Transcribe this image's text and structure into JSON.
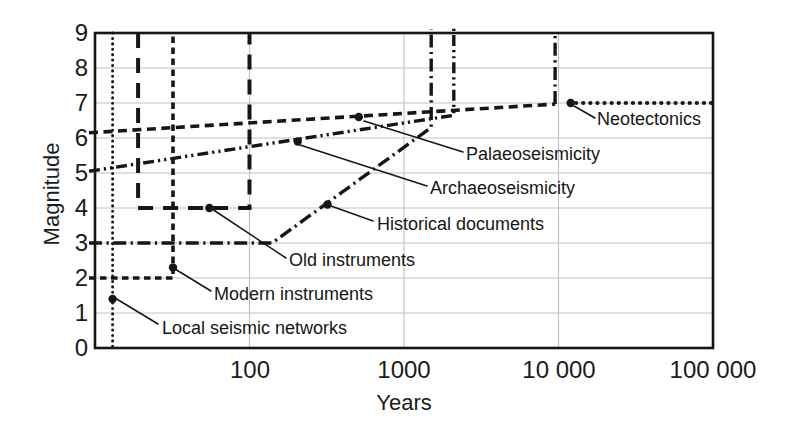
{
  "figure": {
    "background": "#ffffff",
    "ink_color": "#161616",
    "grid_color": "#c2c2c2"
  },
  "chart_data": {
    "type": "line",
    "title": "",
    "x_axis": {
      "title": "Years",
      "scale": "log",
      "range_years": [
        10,
        100000
      ],
      "ticks": [
        {
          "label": "100",
          "years": 100
        },
        {
          "label": "1000",
          "years": 1000
        },
        {
          "label": "10 000",
          "years": 10000
        },
        {
          "label": "100 000",
          "years": 100000
        }
      ]
    },
    "y_axis": {
      "title": "Magnitude",
      "range": [
        0,
        9
      ],
      "ticks": [
        "9",
        "8",
        "7",
        "6",
        "5",
        "4",
        "3",
        "2",
        "1",
        "0"
      ]
    },
    "grid": {
      "horizontal_at_magnitude": [
        1,
        2,
        3,
        4,
        5,
        6,
        7,
        8
      ],
      "vertical_at_years": [
        100,
        1000,
        10000
      ]
    },
    "series": [
      {
        "id": "local-seismic-networks",
        "label": "Local seismic networks",
        "line_style": "fine-dotted",
        "segments": [
          {
            "path": [
              [
                13,
                9
              ],
              [
                13,
                0
              ]
            ]
          }
        ],
        "marker_point": {
          "years": 13,
          "magnitude": 1.4
        }
      },
      {
        "id": "modern-instruments",
        "label": "Modern instruments",
        "line_style": "short-dash",
        "segments": [
          {
            "path": [
              [
                10,
                2
              ],
              [
                32,
                2
              ],
              [
                32,
                9
              ]
            ]
          }
        ],
        "marker_point": {
          "years": 32,
          "magnitude": 2.3
        }
      },
      {
        "id": "old-instruments",
        "label": "Old instruments",
        "line_style": "long-dash",
        "segments": [
          {
            "path": [
              [
                19,
                9
              ],
              [
                19,
                4
              ],
              [
                100,
                4
              ],
              [
                100,
                9
              ]
            ]
          }
        ],
        "marker_point": {
          "years": 55,
          "magnitude": 4.0
        }
      },
      {
        "id": "historical-documents",
        "label": "Historical documents",
        "line_style": "dash-dot",
        "segments": [
          {
            "path": [
              [
                10,
                3
              ],
              [
                140,
                3
              ],
              [
                1500,
                6.3
              ],
              [
                1500,
                9.1
              ]
            ]
          }
        ],
        "marker_point": {
          "years": 320,
          "magnitude": 4.1
        }
      },
      {
        "id": "archaeoseismicity",
        "label": "Archaeoseismicity",
        "line_style": "dash-dot-dot",
        "segments": [
          {
            "path": [
              [
                10,
                5.05
              ],
              [
                2100,
                6.65
              ],
              [
                2100,
                9.2
              ]
            ]
          }
        ],
        "marker_point": {
          "years": 205,
          "magnitude": 5.9
        }
      },
      {
        "id": "palaeoseismicity",
        "label": "Palaeoseismicity",
        "line_style": "medium-dash",
        "segments": [
          {
            "path": [
              [
                10,
                6.15
              ],
              [
                9500,
                6.97
              ]
            ]
          },
          {
            "path": [
              [
                9500,
                6.97
              ],
              [
                9500,
                9
              ]
            ],
            "style": "dash-dot"
          }
        ],
        "marker_point": {
          "years": 510,
          "magnitude": 6.6
        }
      },
      {
        "id": "neotectonics",
        "label": "Neotectonics",
        "line_style": "bold-dotted",
        "segments": [
          {
            "path": [
              [
                13000,
                7
              ],
              [
                100000,
                7
              ]
            ]
          }
        ],
        "marker_point": {
          "years": 12000,
          "magnitude": 7.0
        }
      }
    ],
    "annotations": [
      {
        "series": "local-seismic-networks",
        "label_px": [
          162,
          319
        ],
        "leader_px": [
          115,
          298,
          158,
          324
        ]
      },
      {
        "series": "modern-instruments",
        "label_px": [
          214,
          285
        ],
        "leader_px": [
          175,
          269,
          211,
          291
        ]
      },
      {
        "series": "old-instruments",
        "label_px": [
          289,
          251
        ],
        "leader_px": [
          212,
          209,
          286,
          258
        ]
      },
      {
        "series": "historical-documents",
        "label_px": [
          377,
          215
        ],
        "leader_px": [
          331,
          206,
          373,
          221
        ]
      },
      {
        "series": "archaeoseismicity",
        "label_px": [
          430,
          179
        ],
        "leader_px": [
          300,
          145,
          427,
          186
        ]
      },
      {
        "series": "palaeoseismicity",
        "label_px": [
          466,
          145
        ],
        "leader_px": [
          364,
          121,
          463,
          152
        ]
      },
      {
        "series": "neotectonics",
        "label_px": [
          597,
          110
        ],
        "leader_px": [
          574,
          106,
          595,
          118
        ]
      }
    ]
  }
}
